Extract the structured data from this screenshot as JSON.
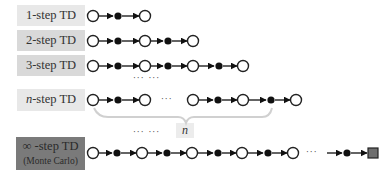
{
  "diagram": {
    "rows": [
      {
        "id": "1-step",
        "label_prefix": "1",
        "label_suffix": "-step TD",
        "sequence": [
          "S",
          "A",
          "S"
        ]
      },
      {
        "id": "2-step",
        "label_prefix": "2",
        "label_suffix": "-step TD",
        "sequence": [
          "S",
          "A",
          "S",
          "A",
          "S"
        ]
      },
      {
        "id": "3-step",
        "label_prefix": "3",
        "label_suffix": "-step TD",
        "sequence": [
          "S",
          "A",
          "S",
          "A",
          "S",
          "A",
          "S"
        ]
      },
      {
        "id": "n-step",
        "label_prefix": "n",
        "label_suffix": "-step TD",
        "sequence": [
          "S",
          "A",
          "S",
          "...",
          "S",
          "A",
          "S",
          "A",
          "S"
        ]
      },
      {
        "id": "mc",
        "label_prefix": "∞",
        "label_suffix": " -step TD",
        "sublabel": "(Monte Carlo)",
        "sequence": [
          "S",
          "A",
          "S",
          "A",
          "S",
          "A",
          "S",
          "A",
          "S",
          "...",
          "A",
          "T"
        ]
      }
    ],
    "ellipsis_between": "··· ···",
    "inline_ellipsis": "···",
    "brace_label": "n",
    "legend": {
      "open_circle": "state",
      "filled_circle": "action",
      "gray_square": "terminal state"
    },
    "colors": {
      "label_light": "#e8e8e8",
      "label_mid": "#d9d9d9",
      "label_dark": "#7a7a7a",
      "terminal": "#6e6e6e",
      "brace": "#d0d0d0"
    }
  }
}
